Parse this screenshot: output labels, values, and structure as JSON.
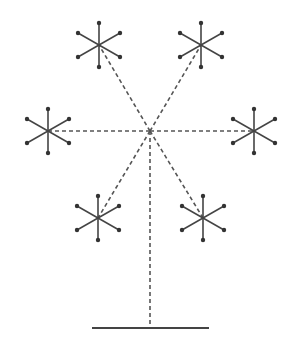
{
  "diagram": {
    "type": "tree-like structure with six star nodes connected by dashed lines to a central hub on a stand",
    "colors": {
      "background": "#ffffff",
      "line": "#444444",
      "dashed_line": "#555555",
      "endpoint": "#333333"
    },
    "hub": {
      "x": 150,
      "y": 131
    },
    "base": {
      "x1": 92,
      "x2": 209,
      "y": 328
    },
    "stem": {
      "x": 150,
      "y1": 131,
      "y2": 328
    },
    "spoke": {
      "vertical_len": 22,
      "diag_dx": 21,
      "diag_dy": 12
    },
    "nodes": [
      {
        "name": "top-left",
        "x": 99,
        "y": 45
      },
      {
        "name": "top-right",
        "x": 201,
        "y": 45
      },
      {
        "name": "left",
        "x": 48,
        "y": 131
      },
      {
        "name": "right",
        "x": 254,
        "y": 131
      },
      {
        "name": "bottom-left",
        "x": 98,
        "y": 218
      },
      {
        "name": "bottom-right",
        "x": 203,
        "y": 218
      }
    ]
  }
}
